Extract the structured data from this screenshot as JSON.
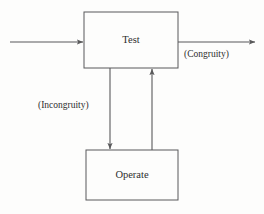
{
  "diagram": {
    "background_color": "#fdfdfc",
    "line_color": "#59595a",
    "text_color": "#2e2e2e",
    "nodes": [
      {
        "id": "test",
        "label": "Test",
        "shape": "rectangle",
        "x": 84,
        "y": 12,
        "width": 94,
        "height": 56,
        "label_x": 131,
        "label_y": 41
      },
      {
        "id": "operate",
        "label": "Operate",
        "shape": "rectangle",
        "x": 86,
        "y": 150,
        "width": 92,
        "height": 50,
        "label_x": 132,
        "label_y": 176
      }
    ],
    "edges": [
      {
        "id": "input",
        "label": "",
        "from": "external-input",
        "to": "test",
        "direction": "right",
        "arrowhead": true
      },
      {
        "id": "congruity-exit",
        "label": "(Congruity)",
        "from": "test",
        "to": "external-output",
        "direction": "right",
        "arrowhead": true,
        "label_x": 184,
        "label_y": 55
      },
      {
        "id": "incongruity-down",
        "label": "(Incongruity)",
        "from": "test",
        "to": "operate",
        "direction": "down",
        "arrowhead": true,
        "label_x": 38,
        "label_y": 106
      },
      {
        "id": "operate-return",
        "label": "",
        "from": "operate",
        "to": "test",
        "direction": "up",
        "arrowhead": true
      }
    ]
  }
}
